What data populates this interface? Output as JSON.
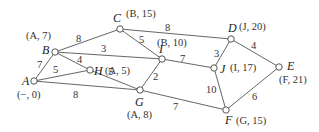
{
  "diagram": {
    "title": "",
    "type": "weighted-graph-shortest-path",
    "nodes": [
      {
        "id": "A",
        "x": 34,
        "y": 81,
        "tag": "(−, 0)",
        "lx": 22,
        "ly": 85,
        "tx": 17,
        "ty": 98
      },
      {
        "id": "B",
        "x": 55,
        "y": 52,
        "tag": "(A, 7)",
        "lx": 42,
        "ly": 54,
        "tx": 26,
        "ty": 39
      },
      {
        "id": "C",
        "x": 120,
        "y": 29,
        "tag": "(B, 15)",
        "lx": 113,
        "ly": 22,
        "tx": 126,
        "ty": 17
      },
      {
        "id": "D",
        "x": 231,
        "y": 39,
        "tag": "(J, 20)",
        "lx": 228,
        "ly": 32,
        "tx": 239,
        "ty": 30
      },
      {
        "id": "E",
        "x": 279,
        "y": 67,
        "tag": "(F, 21)",
        "lx": 287,
        "ly": 70,
        "tx": 279,
        "ty": 83
      },
      {
        "id": "F",
        "x": 226,
        "y": 110,
        "tag": "(G, 15)",
        "lx": 225,
        "ly": 124,
        "tx": 236,
        "ty": 124
      },
      {
        "id": "G",
        "x": 140,
        "y": 90,
        "tag": "(A, 8)",
        "lx": 135,
        "ly": 106,
        "tx": 127,
        "ty": 118
      },
      {
        "id": "H",
        "x": 90,
        "y": 70,
        "tag": "(A, 5)",
        "lx": 94,
        "ly": 75,
        "tx": 105,
        "ty": 74
      },
      {
        "id": "I",
        "x": 162,
        "y": 59,
        "tag": "(B, 10)",
        "lx": 159,
        "ly": 53,
        "tx": 157,
        "ty": 46
      },
      {
        "id": "J",
        "x": 214,
        "y": 68,
        "tag": "(I, 17)",
        "lx": 220,
        "ly": 73,
        "tx": 230,
        "ty": 71
      }
    ],
    "edges": [
      {
        "from": "A",
        "to": "B",
        "weight": "7",
        "wx": 37,
        "wy": 68
      },
      {
        "from": "A",
        "to": "H",
        "weight": "5",
        "wx": 53,
        "wy": 73
      },
      {
        "from": "A",
        "to": "G",
        "weight": "8",
        "wx": 73,
        "wy": 98
      },
      {
        "from": "B",
        "to": "C",
        "weight": "8",
        "wx": 76,
        "wy": 42
      },
      {
        "from": "B",
        "to": "I",
        "weight": "3",
        "wx": 101,
        "wy": 52
      },
      {
        "from": "B",
        "to": "H",
        "weight": "4",
        "wx": 77,
        "wy": 63
      },
      {
        "from": "H",
        "to": "G",
        "weight": "5",
        "wx": 108,
        "wy": 75
      },
      {
        "from": "C",
        "to": "I",
        "weight": "5",
        "wx": 139,
        "wy": 43
      },
      {
        "from": "C",
        "to": "D",
        "weight": "8",
        "wx": 165,
        "wy": 31
      },
      {
        "from": "I",
        "to": "G",
        "weight": "2",
        "wx": 153,
        "wy": 80
      },
      {
        "from": "I",
        "to": "J",
        "weight": "7",
        "wx": 180,
        "wy": 62
      },
      {
        "from": "G",
        "to": "F",
        "weight": "7",
        "wx": 173,
        "wy": 110
      },
      {
        "from": "J",
        "to": "D",
        "weight": "3",
        "wx": 214,
        "wy": 57
      },
      {
        "from": "J",
        "to": "F",
        "weight": "10",
        "wx": 206,
        "wy": 93
      },
      {
        "from": "D",
        "to": "E",
        "weight": "4",
        "wx": 251,
        "wy": 49
      },
      {
        "from": "F",
        "to": "E",
        "weight": "6",
        "wx": 252,
        "wy": 100
      }
    ]
  }
}
